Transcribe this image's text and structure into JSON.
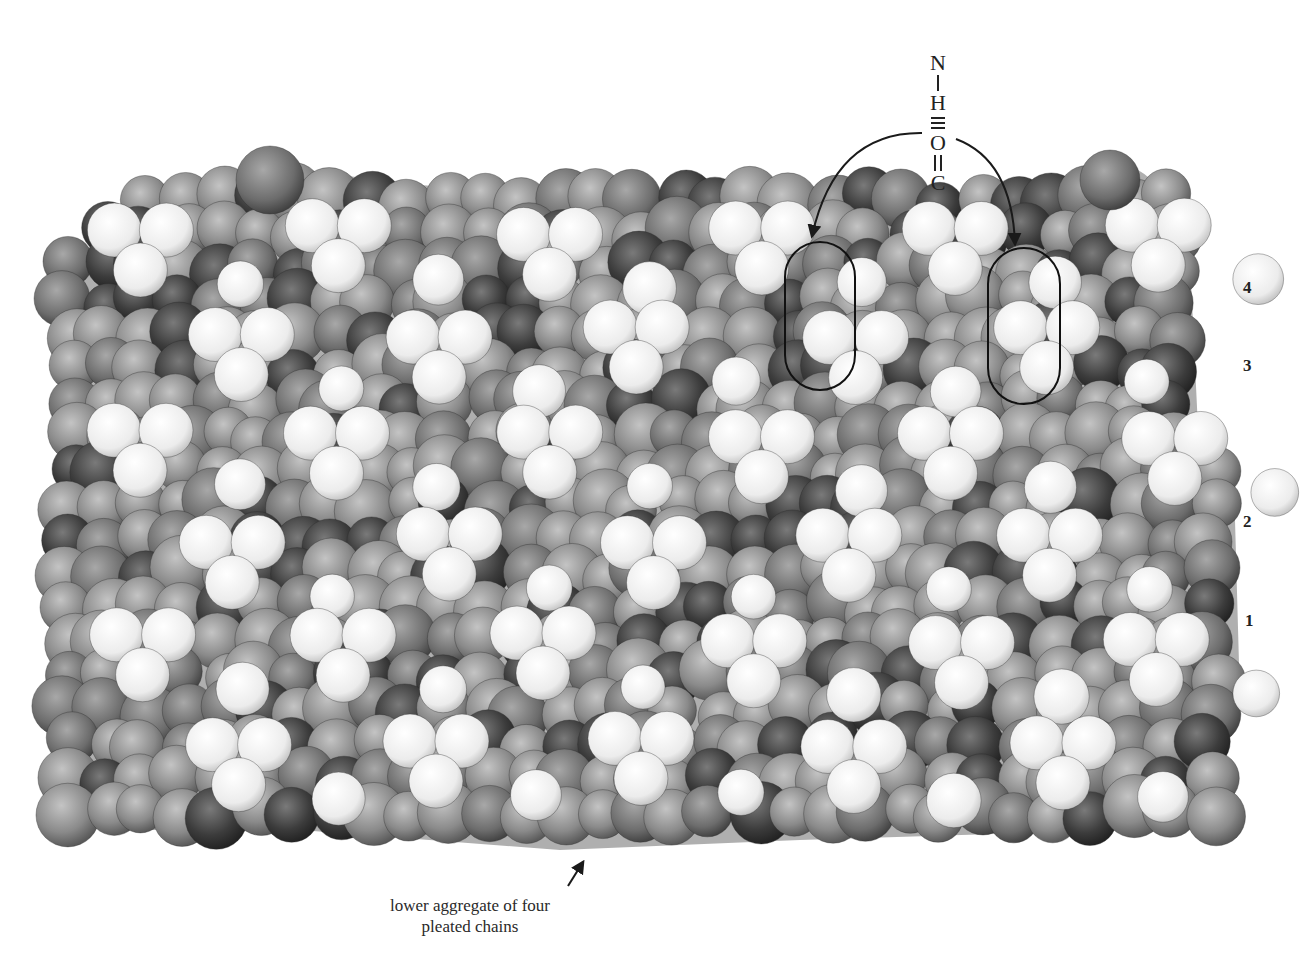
{
  "figure": {
    "formula": {
      "atoms": [
        "N",
        "H",
        "O",
        "C"
      ],
      "bonds": [
        "single",
        "hydrogen-triple",
        "double"
      ],
      "description": "N–H ≡ O=C hydrogen bond"
    },
    "layer_labels": [
      {
        "label": "4",
        "x": 1243,
        "y": 279
      },
      {
        "label": "3",
        "x": 1243,
        "y": 357
      },
      {
        "label": "2",
        "x": 1243,
        "y": 513
      },
      {
        "label": "1",
        "x": 1245,
        "y": 612
      }
    ],
    "caption": {
      "line1": "lower aggregate of four",
      "line2": "pleated chains"
    },
    "highlight_ovals": [
      {
        "name": "left-oval",
        "x": 785,
        "y": 242,
        "w": 70,
        "h": 148
      },
      {
        "name": "right-oval",
        "x": 988,
        "y": 248,
        "w": 72,
        "h": 156
      }
    ],
    "colors": {
      "background": "#ffffff",
      "ink": "#222222",
      "white_atom": "#f2f2f2",
      "grey_atom": "#8c8c8c",
      "dark_atom": "#3a3a3a"
    }
  }
}
